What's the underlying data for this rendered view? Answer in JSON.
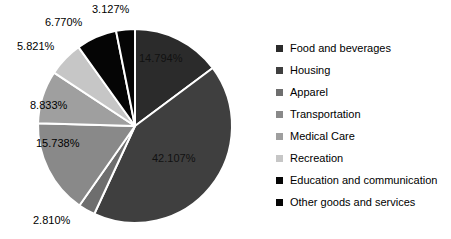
{
  "chart_data": {
    "type": "pie",
    "title": "",
    "subtitle": "",
    "xlabel": "",
    "ylabel": "",
    "legend_position": "right",
    "grid": false,
    "start_angle_deg": 0,
    "direction": "clockwise",
    "categories": [
      "Food and beverages",
      "Housing",
      "Apparel",
      "Transportation",
      "Medical Care",
      "Recreation",
      "Education and communication",
      "Other goods and services"
    ],
    "values": [
      14.794,
      42.107,
      2.81,
      15.738,
      8.833,
      5.821,
      6.77,
      3.127
    ],
    "value_labels": [
      "14.794%",
      "42.107%",
      "2.810%",
      "15.738%",
      "8.833%",
      "5.821%",
      "6.770%",
      "3.127%"
    ],
    "colors": [
      "#2b2b2b",
      "#3f3f3f",
      "#6e6e6e",
      "#898989",
      "#9f9f9f",
      "#c6c6c6",
      "#050505",
      "#050505"
    ],
    "slice_border_color": "#ffffff",
    "units": "percent"
  },
  "legend": {
    "items": [
      {
        "label": "Food and beverages",
        "color": "#2b2b2b"
      },
      {
        "label": "Housing",
        "color": "#3f3f3f"
      },
      {
        "label": "Apparel",
        "color": "#6e6e6e"
      },
      {
        "label": "Transportation",
        "color": "#898989"
      },
      {
        "label": "Medical Care",
        "color": "#9f9f9f"
      },
      {
        "label": "Recreation",
        "color": "#c6c6c6"
      },
      {
        "label": "Education and communication",
        "color": "#050505"
      },
      {
        "label": "Other goods and services",
        "color": "#050505"
      }
    ]
  },
  "labels": {
    "food": "14.794%",
    "housing": "42.107%",
    "apparel": "2.810%",
    "transportation": "15.738%",
    "medical": "8.833%",
    "recreation": "5.821%",
    "education": "6.770%",
    "other": "3.127%"
  }
}
